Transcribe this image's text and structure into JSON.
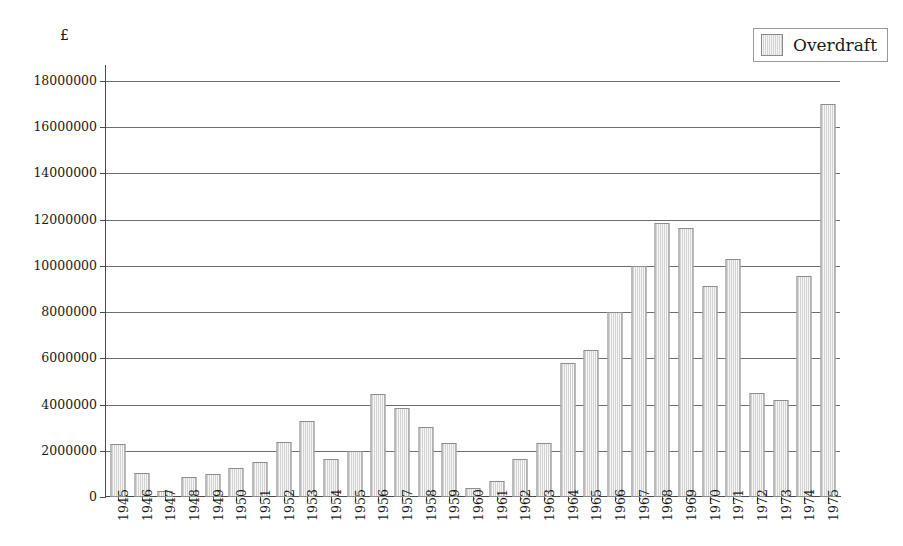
{
  "chart_data": {
    "type": "bar",
    "title": "",
    "xlabel": "",
    "ylabel": "£",
    "ylim": [
      0,
      18000000
    ],
    "ytick_step": 2000000,
    "yticks": [
      0,
      2000000,
      4000000,
      6000000,
      8000000,
      10000000,
      12000000,
      14000000,
      16000000,
      18000000
    ],
    "ytick_labels": [
      "0",
      "2000000",
      "4000000",
      "6000000",
      "8000000",
      "10000000",
      "12000000",
      "14000000",
      "16000000",
      "18000000"
    ],
    "grid": true,
    "legend_position": "top-right",
    "legend": [
      "Overdraft"
    ],
    "series": [
      {
        "name": "Overdraft",
        "color": "#d6d6d6",
        "values": [
          2300000,
          1050000,
          250000,
          850000,
          1000000,
          1250000,
          1500000,
          2400000,
          3300000,
          1650000,
          2000000,
          4450000,
          3850000,
          3050000,
          2350000,
          400000,
          700000,
          1650000,
          2350000,
          5800000,
          6350000,
          8000000,
          10000000,
          11850000,
          11650000,
          9150000,
          10300000,
          4500000,
          4200000,
          9550000,
          17000000
        ]
      }
    ],
    "categories": [
      "1945",
      "1946",
      "1947",
      "1948",
      "1949",
      "1950",
      "1951",
      "1952",
      "1953",
      "1954",
      "1955",
      "1956",
      "1957",
      "1958",
      "1959",
      "1960",
      "1961",
      "1962",
      "1963",
      "1964",
      "1965",
      "1966",
      "1967",
      "1968",
      "1969",
      "1970",
      "1971",
      "1972",
      "1973",
      "1974",
      "1975"
    ]
  },
  "axis": {
    "currency_symbol": "£"
  },
  "legend": {
    "entry_label": "Overdraft",
    "swatch_color": "#d6d6d6"
  }
}
